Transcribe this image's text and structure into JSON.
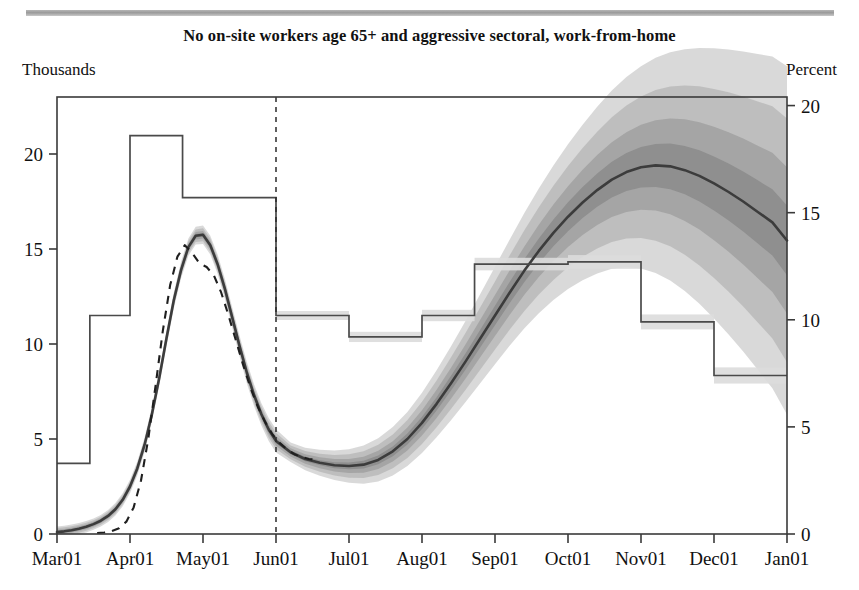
{
  "header": {
    "clipped_caption": "",
    "rule_color": "#a8a8a8"
  },
  "chart_title": "No on-site workers age 65+ and aggressive sectoral, work-from-home",
  "axes": {
    "left_unit": "Thousands",
    "right_unit": "Percent"
  },
  "chart_data": {
    "type": "line",
    "title": "No on-site workers age 65+ and aggressive sectoral, work-from-home",
    "subtitle": "",
    "xlabel": "",
    "ylabel": "Thousands",
    "y2label": "Percent",
    "grid": false,
    "legend_position": "none",
    "x_tick_labels": [
      "Mar01",
      "Apr01",
      "May01",
      "Jun01",
      "Jul01",
      "Aug01",
      "Sep01",
      "Oct01",
      "Nov01",
      "Dec01",
      "Jan01"
    ],
    "x_tick_index": [
      0,
      1,
      2,
      3,
      4,
      5,
      6,
      7,
      8,
      9,
      10
    ],
    "ylim": [
      0,
      23
    ],
    "y_tick_values": [
      0,
      5,
      10,
      15,
      20
    ],
    "y_tick_labels": [
      "0",
      "5",
      "10",
      "15",
      "20"
    ],
    "y2lim": [
      0,
      20.4
    ],
    "y2_tick_values": [
      0,
      5,
      10,
      15,
      20
    ],
    "y2_tick_labels": [
      "0",
      "5",
      "10",
      "15",
      "20"
    ],
    "forecast_divider_x": 3.0,
    "colors": {
      "median_line": "#3c3c3c",
      "dashed_alt": "#1f1f1f",
      "step_line": "#4a4a4a",
      "band_90": "#d7d7d7",
      "band_70": "#bdbdbd",
      "band_50": "#a3a3a3",
      "band_30": "#8d8d8d",
      "axis": "#3a3a3a"
    },
    "series": [
      {
        "name": "Median projection (deaths, thousands)",
        "style": "solid",
        "x": [
          0.0,
          0.1,
          0.2,
          0.3,
          0.4,
          0.5,
          0.6,
          0.7,
          0.8,
          0.9,
          1.0,
          1.1,
          1.2,
          1.3,
          1.4,
          1.5,
          1.6,
          1.7,
          1.8,
          1.9,
          2.0,
          2.1,
          2.2,
          2.3,
          2.4,
          2.5,
          2.6,
          2.7,
          2.8,
          2.9,
          3.0,
          3.2,
          3.4,
          3.6,
          3.8,
          4.0,
          4.2,
          4.4,
          4.6,
          4.8,
          5.0,
          5.2,
          5.4,
          5.6,
          5.8,
          6.0,
          6.2,
          6.4,
          6.6,
          6.8,
          7.0,
          7.2,
          7.4,
          7.6,
          7.8,
          8.0,
          8.2,
          8.4,
          8.6,
          8.8,
          9.0,
          9.2,
          9.4,
          9.6,
          9.8,
          10.0
        ],
        "y": [
          0.1,
          0.14,
          0.2,
          0.28,
          0.38,
          0.52,
          0.7,
          0.95,
          1.3,
          1.8,
          2.5,
          3.45,
          4.7,
          6.3,
          8.2,
          10.3,
          12.3,
          13.9,
          15.1,
          15.7,
          15.75,
          15.2,
          14.2,
          12.9,
          11.4,
          9.9,
          8.5,
          7.3,
          6.3,
          5.5,
          4.9,
          4.3,
          3.95,
          3.75,
          3.62,
          3.58,
          3.65,
          3.9,
          4.35,
          5.0,
          5.85,
          6.85,
          7.95,
          9.1,
          10.3,
          11.5,
          12.7,
          13.85,
          14.9,
          15.85,
          16.7,
          17.45,
          18.1,
          18.65,
          19.05,
          19.3,
          19.4,
          19.35,
          19.15,
          18.85,
          18.45,
          18.0,
          17.5,
          16.95,
          16.4,
          15.45
        ]
      },
      {
        "name": "Alternative scenario (dashed)",
        "style": "dashed",
        "x": [
          0.55,
          0.65,
          0.75,
          0.85,
          0.95,
          1.05,
          1.15,
          1.25,
          1.35,
          1.45,
          1.55,
          1.65,
          1.75,
          1.85,
          1.95,
          2.05,
          2.15,
          2.25,
          2.35,
          2.45,
          2.55,
          2.65,
          2.75,
          2.85,
          2.95,
          3.05,
          3.15,
          3.25,
          3.35,
          3.45,
          3.55
        ],
        "y": [
          0.05,
          0.08,
          0.15,
          0.3,
          0.65,
          1.4,
          2.8,
          5.0,
          7.8,
          10.7,
          13.1,
          14.6,
          15.2,
          14.8,
          14.25,
          14.05,
          13.6,
          12.7,
          11.5,
          10.2,
          8.9,
          7.7,
          6.7,
          5.9,
          5.25,
          4.8,
          4.45,
          4.2,
          4.05,
          3.95,
          3.9
        ]
      }
    ],
    "fan_bands": [
      {
        "name": "90% interval",
        "shade": "#d9d9d9"
      },
      {
        "name": "70% interval",
        "shade": "#c0c0c0"
      },
      {
        "name": "50% interval",
        "shade": "#a6a6a6"
      },
      {
        "name": "30% interval",
        "shade": "#909090"
      }
    ],
    "step_series": {
      "name": "Unemployment rate path (percent, right axis)",
      "axis": "right",
      "edges": [
        0.0,
        0.45,
        1.0,
        1.72,
        2.98,
        3.0,
        4.0,
        5.0,
        5.72,
        6.0,
        7.0,
        7.72,
        8.0,
        9.0,
        10.0
      ],
      "values_percent": [
        3.3,
        3.3,
        10.2,
        18.6,
        15.7,
        15.7,
        10.2,
        9.2,
        10.2,
        10.2,
        12.6,
        12.6,
        12.7,
        9.9,
        7.4
      ],
      "steps": [
        {
          "from_x": 0.0,
          "to_x": 0.45,
          "percent": 3.3
        },
        {
          "from_x": 0.45,
          "to_x": 1.0,
          "percent": 10.2
        },
        {
          "from_x": 1.0,
          "to_x": 1.72,
          "percent": 18.6
        },
        {
          "from_x": 1.72,
          "to_x": 3.0,
          "percent": 15.7
        },
        {
          "from_x": 3.0,
          "to_x": 4.0,
          "percent": 10.2
        },
        {
          "from_x": 4.0,
          "to_x": 5.0,
          "percent": 9.2
        },
        {
          "from_x": 5.0,
          "to_x": 5.72,
          "percent": 10.2
        },
        {
          "from_x": 5.72,
          "to_x": 7.0,
          "percent": 12.6
        },
        {
          "from_x": 7.0,
          "to_x": 8.0,
          "percent": 12.7
        },
        {
          "from_x": 8.0,
          "to_x": 9.0,
          "percent": 9.9
        },
        {
          "from_x": 9.0,
          "to_x": 10.0,
          "percent": 7.4
        }
      ]
    }
  }
}
